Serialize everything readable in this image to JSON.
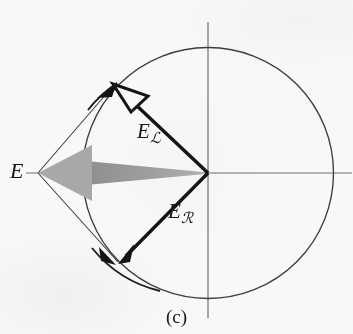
{
  "figure": {
    "caption": "(c)",
    "background_color": "#f8f8f6",
    "ink_color": "#1a1a1a",
    "gray_arrow_color": "#9c9c9c",
    "thin_line_color": "#4a4a4a",
    "circle_stroke_color": "#3c3c3c",
    "axis_color": "#6e6e6e",
    "labels": {
      "resultant": {
        "base": "E",
        "subscript": ""
      },
      "left_circular": {
        "base": "E",
        "subscript": "ℒ"
      },
      "right_circular": {
        "base": "E",
        "subscript": "ℛ"
      }
    },
    "geometry": {
      "center": {
        "x": 208,
        "y": 173
      },
      "radius": 125,
      "left_vector_tip": {
        "x": 113,
        "y": 85
      },
      "right_vector_tip": {
        "x": 118,
        "y": 262
      },
      "resultant_tip": {
        "x": 38,
        "y": 173
      },
      "axis_x_span": [
        26,
        353
      ],
      "axis_y_span": [
        22,
        318
      ]
    }
  }
}
